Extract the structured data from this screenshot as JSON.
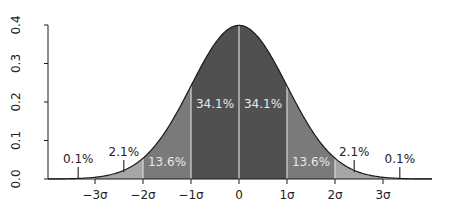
{
  "chart_data": {
    "type": "area",
    "title": "",
    "xlabel": "",
    "ylabel": "",
    "ylim": [
      0,
      0.4
    ],
    "xlim": [
      -4,
      4
    ],
    "grid": false,
    "y_ticks": [
      "0.0",
      "0.1",
      "0.2",
      "0.3",
      "0.4"
    ],
    "x_ticks": [
      "−3σ",
      "−2σ",
      "−1σ",
      "0",
      "1σ",
      "2σ",
      "3σ"
    ],
    "x_tick_values": [
      -3,
      -2,
      -1,
      0,
      1,
      2,
      3
    ],
    "curve": "standard normal probability density",
    "regions": [
      {
        "from": -4,
        "to": -3,
        "label": "0.1%",
        "value": 0.1,
        "color": "#ffffff"
      },
      {
        "from": -3,
        "to": -2,
        "label": "2.1%",
        "value": 2.1,
        "color": "#a6a6a6"
      },
      {
        "from": -2,
        "to": -1,
        "label": "13.6%",
        "value": 13.6,
        "color": "#7a7a7a"
      },
      {
        "from": -1,
        "to": 0,
        "label": "34.1%",
        "value": 34.1,
        "color": "#505050"
      },
      {
        "from": 0,
        "to": 1,
        "label": "34.1%",
        "value": 34.1,
        "color": "#505050"
      },
      {
        "from": 1,
        "to": 2,
        "label": "13.6%",
        "value": 13.6,
        "color": "#7a7a7a"
      },
      {
        "from": 2,
        "to": 3,
        "label": "2.1%",
        "value": 2.1,
        "color": "#a6a6a6"
      },
      {
        "from": 3,
        "to": 4,
        "label": "0.1%",
        "value": 0.1,
        "color": "#ffffff"
      }
    ]
  }
}
